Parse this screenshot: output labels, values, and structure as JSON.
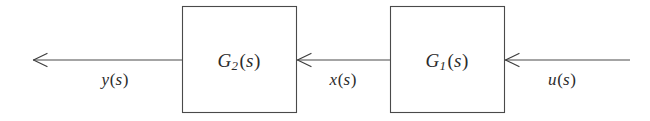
{
  "figure": {
    "type": "block-diagram",
    "background_color": "#ffffff",
    "line_color": "#4a4a4a",
    "text_color": "#2b2b2b",
    "signal_flow": "right-to-left"
  },
  "blocks": [
    {
      "id": "block-g2",
      "name": "G2-block",
      "label_base": "G",
      "label_sub": "2",
      "label_arg": "s",
      "label_full": "G2(s)",
      "x": 182,
      "y": 6,
      "width": 115,
      "height": 107,
      "center_x": 239,
      "center_y": 60
    },
    {
      "id": "block-g1",
      "name": "G1-block",
      "label_base": "G",
      "label_sub": "1",
      "label_arg": "s",
      "label_full": "G1(s)",
      "x": 390,
      "y": 6,
      "width": 115,
      "height": 107,
      "center_x": 447,
      "center_y": 60
    }
  ],
  "signals": [
    {
      "id": "signal-y",
      "name": "output-signal-y",
      "label_base": "y",
      "label_arg": "s",
      "label_full": "y(s)",
      "label_x": 115,
      "label_y": 79,
      "line_from_x": 182,
      "line_to_x": 33,
      "line_y": 60,
      "arrow_tip_x": 33,
      "arrow_direction": "left"
    },
    {
      "id": "signal-x",
      "name": "intermediate-signal-x",
      "label_base": "x",
      "label_arg": "s",
      "label_full": "x(s)",
      "label_x": 343,
      "label_y": 79,
      "line_from_x": 390,
      "line_to_x": 297,
      "line_y": 60,
      "arrow_tip_x": 297,
      "arrow_direction": "left"
    },
    {
      "id": "signal-u",
      "name": "input-signal-u",
      "label_base": "u",
      "label_arg": "s",
      "label_full": "u(s)",
      "label_x": 562,
      "label_y": 79,
      "line_from_x": 630,
      "line_to_x": 505,
      "line_y": 60,
      "arrow_tip_x": 505,
      "arrow_direction": "left"
    }
  ]
}
